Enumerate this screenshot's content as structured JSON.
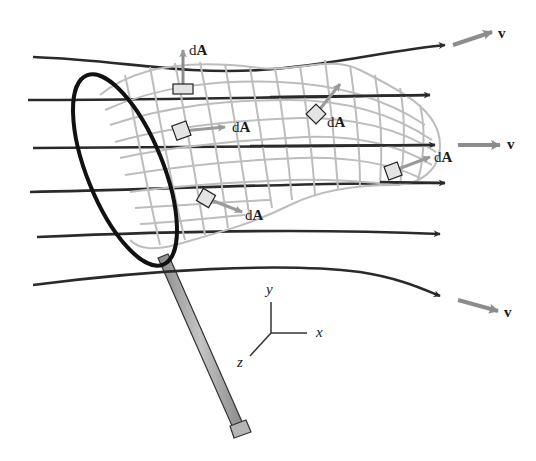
{
  "figure": {
    "colors": {
      "streamline": "#2a2a2a",
      "velocity_vector": "#8c8c8c",
      "mesh": "#bdbdbd",
      "rim": "#111111",
      "handle_fill": "#a8a8a8",
      "area_element_fill": "#e4e4e4"
    },
    "area_elements": [
      {
        "label_d": "d",
        "label_A": "A",
        "x": 183,
        "y": 88
      },
      {
        "label_d": "d",
        "label_A": "A",
        "x": 182,
        "y": 131
      },
      {
        "label_d": "d",
        "label_A": "A",
        "x": 316,
        "y": 114
      },
      {
        "label_d": "d",
        "label_A": "A",
        "x": 393,
        "y": 171
      },
      {
        "label_d": "d",
        "label_A": "A",
        "x": 206,
        "y": 198
      }
    ],
    "velocity_labels": [
      {
        "label": "v",
        "x": 498,
        "y": 35
      },
      {
        "label": "v",
        "x": 507,
        "y": 145
      },
      {
        "label": "v",
        "x": 504,
        "y": 312
      }
    ],
    "axes": {
      "x_label": "x",
      "y_label": "y",
      "z_label": "z"
    },
    "streamline_count": 6
  }
}
